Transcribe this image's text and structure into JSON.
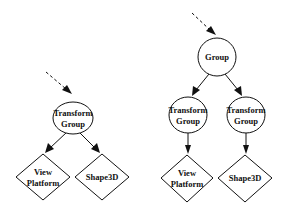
{
  "diagram": {
    "type": "scene-graph",
    "colors": {
      "stroke": "#111111",
      "fill": "#ffffff",
      "background": "#ffffff"
    },
    "left": {
      "nodes": [
        {
          "id": "l_tg",
          "shape": "circle",
          "line1": "Transform",
          "line2": "Group"
        },
        {
          "id": "l_vp",
          "shape": "diamond",
          "line1": "View",
          "line2": "Platform"
        },
        {
          "id": "l_s3d",
          "shape": "diamond",
          "line1": "Shape3D",
          "line2": ""
        }
      ],
      "edges": [
        {
          "from": "parent",
          "to": "l_tg",
          "style": "dashed"
        },
        {
          "from": "l_tg",
          "to": "l_vp",
          "style": "solid"
        },
        {
          "from": "l_tg",
          "to": "l_s3d",
          "style": "solid"
        }
      ]
    },
    "right": {
      "nodes": [
        {
          "id": "r_g",
          "shape": "circle",
          "line1": "Group",
          "line2": ""
        },
        {
          "id": "r_tg1",
          "shape": "circle",
          "line1": "Transform",
          "line2": "Group"
        },
        {
          "id": "r_tg2",
          "shape": "circle",
          "line1": "Transform",
          "line2": "Group"
        },
        {
          "id": "r_vp",
          "shape": "diamond",
          "line1": "View",
          "line2": "Platform"
        },
        {
          "id": "r_s3d",
          "shape": "diamond",
          "line1": "Shape3D",
          "line2": ""
        }
      ],
      "edges": [
        {
          "from": "parent",
          "to": "r_g",
          "style": "dashed"
        },
        {
          "from": "r_g",
          "to": "r_tg1",
          "style": "solid"
        },
        {
          "from": "r_g",
          "to": "r_tg2",
          "style": "solid"
        },
        {
          "from": "r_tg1",
          "to": "r_vp",
          "style": "solid"
        },
        {
          "from": "r_tg2",
          "to": "r_s3d",
          "style": "solid"
        }
      ]
    }
  }
}
